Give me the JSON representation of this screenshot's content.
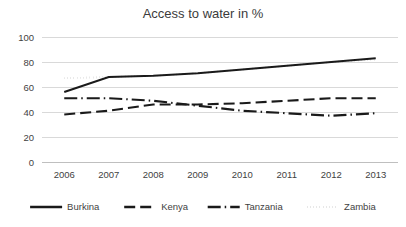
{
  "chart_data": {
    "type": "line",
    "title": "Access to water in %",
    "xlabel": "",
    "ylabel": "",
    "categories": [
      "2006",
      "2007",
      "2008",
      "2009",
      "2010",
      "2011",
      "2012",
      "2013"
    ],
    "ylim": [
      0,
      100
    ],
    "yticks": [
      "0",
      "20",
      "40",
      "60",
      "80",
      "100"
    ],
    "grid": true,
    "legend_position": "bottom",
    "series": [
      {
        "name": "Burkina",
        "style": "solid",
        "values": [
          56,
          68,
          69,
          71,
          74,
          77,
          80,
          83
        ]
      },
      {
        "name": "Kenya",
        "style": "dashed",
        "values": [
          38,
          41,
          46,
          46,
          47,
          49,
          51,
          51
        ]
      },
      {
        "name": "Tanzania",
        "style": "dash-dot",
        "values": [
          51,
          51,
          49,
          45,
          41,
          39,
          37,
          39
        ]
      },
      {
        "name": "Zambia",
        "style": "dotted",
        "values": [
          67,
          68,
          69,
          71,
          74,
          77,
          80,
          82
        ]
      }
    ]
  },
  "colors": {
    "series": "#1a1a1a",
    "grid": "#d9d9d9",
    "text": "#3f3f3f",
    "background": "#ffffff"
  }
}
